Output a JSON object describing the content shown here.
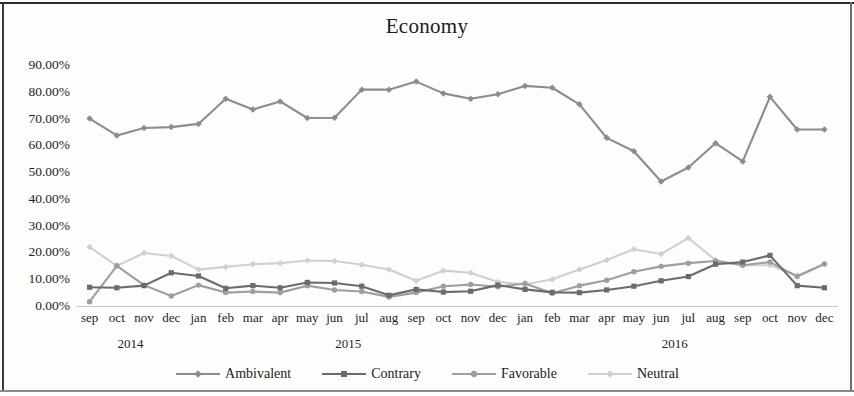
{
  "chart_data": {
    "type": "line",
    "title": "Economy",
    "xlabel": "",
    "ylabel": "",
    "ylim": [
      0,
      90
    ],
    "ytick_values": [
      0,
      10,
      20,
      30,
      40,
      50,
      60,
      70,
      80,
      90
    ],
    "ytick_labels": [
      "0.00%",
      "10.00%",
      "20.00%",
      "30.00%",
      "40.00%",
      "50.00%",
      "60.00%",
      "70.00%",
      "80.00%",
      "90.00%"
    ],
    "grid": false,
    "legend_position": "bottom",
    "categories": [
      "sep",
      "oct",
      "nov",
      "dec",
      "jan",
      "feb",
      "mar",
      "apr",
      "may",
      "jun",
      "jul",
      "aug",
      "sep",
      "oct",
      "nov",
      "dec",
      "jan",
      "feb",
      "mar",
      "apr",
      "may",
      "jun",
      "jul",
      "aug",
      "sep",
      "oct",
      "nov",
      "dec"
    ],
    "year_groups": [
      {
        "label": "2014",
        "start_index": 0,
        "end_index": 3
      },
      {
        "label": "2015",
        "start_index": 4,
        "end_index": 15
      },
      {
        "label": "2016",
        "start_index": 16,
        "end_index": 27
      }
    ],
    "series": [
      {
        "name": "Ambivalent",
        "color": "#8c8c8c",
        "marker": "diamond",
        "values": [
          70.0,
          63.7,
          66.5,
          66.8,
          68.0,
          77.4,
          73.4,
          76.4,
          70.2,
          70.3,
          80.8,
          80.8,
          83.8,
          79.4,
          77.4,
          79.1,
          82.2,
          81.5,
          75.3,
          62.8,
          57.8,
          46.5,
          51.7,
          60.8,
          54.0,
          78.1,
          65.9,
          65.9
        ]
      },
      {
        "name": "Contrary",
        "color": "#6b6b6b",
        "marker": "square",
        "values": [
          7.0,
          6.8,
          7.6,
          12.4,
          11.2,
          6.6,
          7.6,
          6.8,
          8.8,
          8.6,
          7.4,
          4.0,
          6.2,
          5.2,
          5.5,
          7.8,
          6.2,
          5.1,
          5.0,
          6.0,
          7.4,
          9.4,
          11.0,
          15.6,
          16.4,
          18.9,
          7.6,
          6.8
        ]
      },
      {
        "name": "Favorable",
        "color": "#9e9e9e",
        "marker": "circle",
        "values": [
          1.6,
          15.0,
          7.8,
          3.7,
          7.8,
          5.0,
          5.4,
          5.0,
          7.6,
          6.0,
          5.4,
          3.4,
          5.0,
          7.4,
          8.0,
          7.2,
          8.4,
          4.8,
          7.6,
          9.6,
          12.8,
          14.8,
          16.0,
          16.8,
          15.2,
          16.4,
          11.0,
          15.7
        ]
      },
      {
        "name": "Neutral",
        "color": "#d0d0d0",
        "marker": "diamond",
        "values": [
          22.0,
          15.0,
          19.8,
          18.7,
          13.6,
          14.6,
          15.6,
          16.0,
          17.0,
          16.8,
          15.4,
          13.6,
          9.4,
          13.2,
          12.4,
          9.0,
          8.0,
          10.0,
          13.6,
          17.2,
          21.2,
          19.4,
          25.4,
          17.1,
          15.2,
          15.2,
          11.4,
          15.7
        ]
      }
    ]
  }
}
